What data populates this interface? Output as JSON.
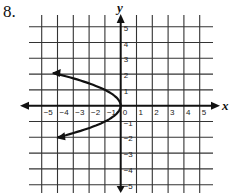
{
  "problem_number": "8.",
  "chart_data": {
    "type": "line",
    "title": "",
    "xlabel": "x",
    "ylabel": "y",
    "xlim": [
      -5,
      5
    ],
    "ylim": [
      -5,
      5
    ],
    "grid": true,
    "x_ticks": [
      "-5",
      "-4",
      "-3",
      "-2",
      "-1",
      "0",
      "1",
      "2",
      "3",
      "4",
      "5"
    ],
    "y_ticks": [
      "5",
      "4",
      "3",
      "2",
      "1",
      "-1",
      "-2",
      "-3",
      "-4",
      "-5"
    ],
    "series": [
      {
        "name": "x = -y^2",
        "description": "Parabola opening left with vertex at origin; arrows at both ends",
        "points": [
          [
            -4.3,
            2.07
          ],
          [
            -3.24,
            1.8
          ],
          [
            -2.25,
            1.5
          ],
          [
            -1.0,
            1.0
          ],
          [
            -0.25,
            0.5
          ],
          [
            0,
            0
          ],
          [
            -0.25,
            -0.5
          ],
          [
            -1.0,
            -1.0
          ],
          [
            -2.25,
            -1.5
          ],
          [
            -3.9,
            -2.28
          ]
        ],
        "color": "#111111"
      }
    ]
  },
  "colors": {
    "grid": "#333333",
    "axis": "#111111",
    "curve": "#111111"
  }
}
